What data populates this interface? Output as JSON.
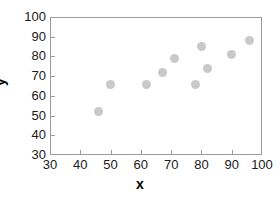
{
  "chart_data": {
    "type": "scatter",
    "title": "",
    "xlabel": "x",
    "ylabel": "y",
    "xlim": [
      30,
      100
    ],
    "ylim": [
      30,
      100
    ],
    "xticks": [
      30,
      40,
      50,
      60,
      70,
      80,
      90,
      100
    ],
    "yticks": [
      30,
      40,
      50,
      60,
      70,
      80,
      90,
      100
    ],
    "grid": false,
    "legend": null,
    "marker_color": "#c9c9c9",
    "axis_color": "#9a9a9a",
    "series": [
      {
        "name": "",
        "points": [
          {
            "x": 46,
            "y": 52
          },
          {
            "x": 50,
            "y": 66
          },
          {
            "x": 62,
            "y": 66
          },
          {
            "x": 67,
            "y": 72
          },
          {
            "x": 71,
            "y": 79
          },
          {
            "x": 78,
            "y": 66
          },
          {
            "x": 80,
            "y": 85
          },
          {
            "x": 82,
            "y": 74
          },
          {
            "x": 90,
            "y": 81
          },
          {
            "x": 96,
            "y": 88
          }
        ]
      }
    ]
  }
}
